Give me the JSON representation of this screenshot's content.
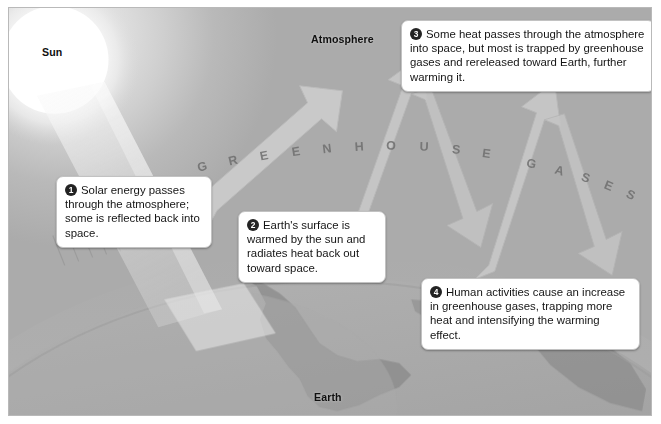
{
  "figure": {
    "background_color": "#b4b4b4",
    "border_color": "#b9b9b9"
  },
  "labels": {
    "sun": "Sun",
    "atmosphere": "Atmosphere",
    "earth": "Earth",
    "greenhouse_gases": "GREENHOUSE GASES"
  },
  "callouts": [
    {
      "number": "1",
      "text": "Solar energy passes through the atmosphere; some is reflected back into space."
    },
    {
      "number": "2",
      "text": "Earth's surface is warmed by the sun and radiates heat back out toward space."
    },
    {
      "number": "3",
      "text": "Some heat passes through the atmosphere into space, but most is trapped by greenhouse gases and rereleased toward Earth, further warming it."
    },
    {
      "number": "4",
      "text": "Human activities cause an increase in greenhouse gases, trapping more heat and intensifying the warming effect."
    }
  ],
  "colors": {
    "badge": "#232323",
    "callout_background": "#ffffff",
    "callout_border": "#c2c2c2",
    "arrow": "#c6c6c6",
    "sun": "#fdfdfd",
    "earth_land": "#8f8f8f",
    "earth_ocean": "#a6a6a6",
    "ghg_text": "#6e6e6e"
  },
  "ghg_letters": [
    {
      "ch": "G",
      "x": 195,
      "y": 163,
      "r": -14
    },
    {
      "ch": "R",
      "x": 226,
      "y": 157,
      "r": -13
    },
    {
      "ch": "E",
      "x": 257,
      "y": 152,
      "r": -11
    },
    {
      "ch": "E",
      "x": 289,
      "y": 148,
      "r": -9
    },
    {
      "ch": "N",
      "x": 320,
      "y": 145,
      "r": -7
    },
    {
      "ch": "H",
      "x": 352,
      "y": 143,
      "r": -4
    },
    {
      "ch": "O",
      "x": 384,
      "y": 142,
      "r": -1
    },
    {
      "ch": "U",
      "x": 417,
      "y": 143,
      "r": 2
    },
    {
      "ch": "S",
      "x": 449,
      "y": 146,
      "r": 5
    },
    {
      "ch": "E",
      "x": 479,
      "y": 150,
      "r": 8
    },
    {
      "ch": "G",
      "x": 524,
      "y": 160,
      "r": 13
    },
    {
      "ch": "A",
      "x": 552,
      "y": 167,
      "r": 16
    },
    {
      "ch": "S",
      "x": 578,
      "y": 174,
      "r": 19
    },
    {
      "ch": "E",
      "x": 601,
      "y": 182,
      "r": 22
    },
    {
      "ch": "S",
      "x": 623,
      "y": 191,
      "r": 25
    }
  ]
}
